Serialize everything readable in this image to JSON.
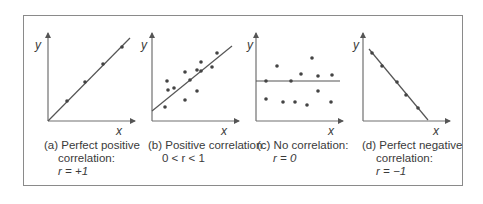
{
  "figure": {
    "panels": [
      {
        "id": "a",
        "caption_line1": "(a) Perfect positive",
        "caption_line2": "correlation:",
        "caption_line3": "r = +1",
        "x_label": "x",
        "y_label": "y"
      },
      {
        "id": "b",
        "caption_line1": "(b) Positive correlation:",
        "caption_line2": "0 < r < 1",
        "x_label": "x",
        "y_label": "y"
      },
      {
        "id": "c",
        "caption_line1": "(c) No correlation:",
        "caption_line2": "r = 0",
        "x_label": "x",
        "y_label": "y"
      },
      {
        "id": "d",
        "caption_line1": "(d) Perfect negative",
        "caption_line2": "correlation:",
        "caption_line3": "r = −1",
        "x_label": "x",
        "y_label": "y"
      }
    ],
    "colors": {
      "axis": "#707070",
      "line": "#555555",
      "point": "#444444",
      "frame": "#8a8a8a"
    }
  },
  "chart_data": [
    {
      "type": "scatter",
      "title": "(a) Perfect positive correlation: r = +1",
      "xlabel": "x",
      "ylabel": "y",
      "r": 1,
      "points": [
        [
          67,
          101
        ],
        [
          85,
          82
        ],
        [
          103,
          64
        ],
        [
          122,
          47
        ]
      ],
      "fit_line": [
        [
          48,
          121
        ],
        [
          130,
          38
        ]
      ]
    },
    {
      "type": "scatter",
      "title": "(b) Positive correlation: 0 < r < 1",
      "xlabel": "x",
      "ylabel": "y",
      "r_range": "0 < r < 1",
      "points": [
        [
          165,
          107
        ],
        [
          167,
          81
        ],
        [
          168,
          90
        ],
        [
          174,
          88
        ],
        [
          185,
          100
        ],
        [
          185,
          72
        ],
        [
          190,
          80
        ],
        [
          197,
          70
        ],
        [
          197,
          91
        ],
        [
          201,
          62
        ],
        [
          201,
          71
        ],
        [
          212,
          67
        ],
        [
          217,
          53
        ]
      ],
      "fit_line": [
        [
          152,
          111
        ],
        [
          232,
          46
        ]
      ]
    },
    {
      "type": "scatter",
      "title": "(c) No correlation: r = 0",
      "xlabel": "x",
      "ylabel": "y",
      "r": 0,
      "points": [
        [
          266,
          81
        ],
        [
          266,
          99
        ],
        [
          277,
          66
        ],
        [
          283,
          102
        ],
        [
          291,
          81
        ],
        [
          295,
          102
        ],
        [
          301,
          74
        ],
        [
          307,
          105
        ],
        [
          312,
          58
        ],
        [
          318,
          76
        ],
        [
          318,
          91
        ],
        [
          332,
          75
        ],
        [
          331,
          102
        ]
      ],
      "fit_line": [
        [
          256,
          81
        ],
        [
          340,
          81
        ]
      ]
    },
    {
      "type": "scatter",
      "title": "(d) Perfect negative correlation: r = −1",
      "xlabel": "x",
      "ylabel": "y",
      "r": -1,
      "points": [
        [
          372,
          53
        ],
        [
          382,
          66
        ],
        [
          397,
          82
        ],
        [
          406,
          95
        ],
        [
          418,
          108
        ]
      ],
      "fit_line": [
        [
          369,
          49
        ],
        [
          428,
          120
        ]
      ]
    }
  ]
}
